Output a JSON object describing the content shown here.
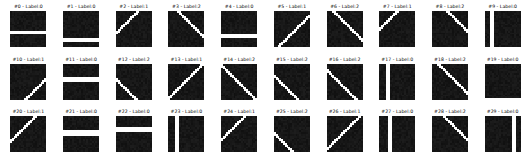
{
  "figure": {
    "background_color": "#ffffff",
    "foreground_color": "#000000",
    "line_color": "#ffffff",
    "image_background_color": "#141414",
    "grid_rows": 3,
    "grid_cols": 10,
    "tile_pixels": 20,
    "total_samples": 30
  },
  "chart_data": {
    "type": "heatmap",
    "title": "",
    "xlabel": "",
    "ylabel": "",
    "legend": [
      "Label:0",
      "Label:1",
      "Label:2"
    ],
    "categories": [
      "Label:0",
      "Label:1",
      "Label:2"
    ],
    "values": [
      13,
      8,
      9
    ],
    "samples": [
      {
        "index": 0,
        "title": "#0 - Label:0",
        "label": 0,
        "pattern": "horizontal",
        "pos": 0.62,
        "thickness": 2,
        "orientation": "h"
      },
      {
        "index": 1,
        "title": "#1 - Label:0",
        "label": 0,
        "pattern": "horizontal",
        "pos": 0.86,
        "thickness": 2,
        "orientation": "h"
      },
      {
        "index": 2,
        "title": "#2 - Label:1",
        "label": 1,
        "pattern": "diagonal-up",
        "pos": 0.1,
        "thickness": 2,
        "orientation": "d1"
      },
      {
        "index": 3,
        "title": "#3 - Label:2",
        "label": 2,
        "pattern": "diagonal-down",
        "pos": 0.18,
        "thickness": 2,
        "orientation": "d2"
      },
      {
        "index": 4,
        "title": "#4 - Label:0",
        "label": 0,
        "pattern": "horizontal",
        "pos": 0.72,
        "thickness": 2,
        "orientation": "h"
      },
      {
        "index": 5,
        "title": "#5 - Label:1",
        "label": 1,
        "pattern": "diagonal-up",
        "pos": 0.62,
        "thickness": 2,
        "orientation": "d1"
      },
      {
        "index": 6,
        "title": "#6 - Label:2",
        "label": 2,
        "pattern": "diagonal-down",
        "pos": 0.3,
        "thickness": 2,
        "orientation": "d2"
      },
      {
        "index": 7,
        "title": "#7 - Label:1",
        "label": 1,
        "pattern": "diagonal-up",
        "pos": 0.02,
        "thickness": 2,
        "orientation": "d1"
      },
      {
        "index": 8,
        "title": "#8 - Label:2",
        "label": 2,
        "pattern": "diagonal-down",
        "pos": 0.05,
        "thickness": 2,
        "orientation": "d2"
      },
      {
        "index": 9,
        "title": "#9 - Label:0",
        "label": 0,
        "pattern": "vertical",
        "pos": 0.14,
        "thickness": 2,
        "orientation": "v"
      },
      {
        "index": 10,
        "title": "#10 - Label:1",
        "label": 1,
        "pattern": "diagonal-up",
        "pos": 0.92,
        "thickness": 2,
        "orientation": "d1"
      },
      {
        "index": 11,
        "title": "#11 - Label:0",
        "label": 0,
        "pattern": "horizontal",
        "pos": 0.42,
        "thickness": 3,
        "orientation": "h"
      },
      {
        "index": 12,
        "title": "#12 - Label:2",
        "label": 2,
        "pattern": "diagonal-down",
        "pos": 0.9,
        "thickness": 2,
        "orientation": "d2"
      },
      {
        "index": 13,
        "title": "#13 - Label:1",
        "label": 1,
        "pattern": "diagonal-up",
        "pos": 0.44,
        "thickness": 2,
        "orientation": "d1"
      },
      {
        "index": 14,
        "title": "#14 - Label:2",
        "label": 2,
        "pattern": "diagonal-down",
        "pos": 0.48,
        "thickness": 2,
        "orientation": "d2"
      },
      {
        "index": 15,
        "title": "#15 - Label:2",
        "label": 2,
        "pattern": "diagonal-down",
        "pos": 0.82,
        "thickness": 2,
        "orientation": "d2"
      },
      {
        "index": 16,
        "title": "#16 - Label:2",
        "label": 2,
        "pattern": "diagonal-down",
        "pos": 0.66,
        "thickness": 2,
        "orientation": "d2"
      },
      {
        "index": 17,
        "title": "#17 - Label:0",
        "label": 0,
        "pattern": "vertical",
        "pos": 0.2,
        "thickness": 2,
        "orientation": "v"
      },
      {
        "index": 18,
        "title": "#18 - Label:2",
        "label": 2,
        "pattern": "diagonal-down",
        "pos": 0.28,
        "thickness": 2,
        "orientation": "d2"
      },
      {
        "index": 19,
        "title": "#19 - Label:0",
        "label": 0,
        "pattern": "horizontal",
        "pos": 0.98,
        "thickness": 1,
        "orientation": "h"
      },
      {
        "index": 20,
        "title": "#20 - Label:1",
        "label": 1,
        "pattern": "diagonal-up",
        "pos": 0.22,
        "thickness": 2,
        "orientation": "d1"
      },
      {
        "index": 21,
        "title": "#21 - Label:0",
        "label": 0,
        "pattern": "horizontal",
        "pos": 0.48,
        "thickness": 3,
        "orientation": "h"
      },
      {
        "index": 22,
        "title": "#22 - Label:0",
        "label": 0,
        "pattern": "horizontal",
        "pos": 0.34,
        "thickness": 3,
        "orientation": "h"
      },
      {
        "index": 23,
        "title": "#23 - Label:0",
        "label": 0,
        "pattern": "vertical",
        "pos": 0.24,
        "thickness": 2,
        "orientation": "v"
      },
      {
        "index": 24,
        "title": "#24 - Label:1",
        "label": 1,
        "pattern": "diagonal-up",
        "pos": 0.16,
        "thickness": 2,
        "orientation": "d1"
      },
      {
        "index": 25,
        "title": "#25 - Label:2",
        "label": 2,
        "pattern": "diagonal-down",
        "pos": 0.96,
        "thickness": 2,
        "orientation": "d2"
      },
      {
        "index": 26,
        "title": "#26 - Label:1",
        "label": 1,
        "pattern": "diagonal-up",
        "pos": 0.4,
        "thickness": 2,
        "orientation": "d1"
      },
      {
        "index": 27,
        "title": "#27 - Label:0",
        "label": 0,
        "pattern": "vertical",
        "pos": 0.26,
        "thickness": 2,
        "orientation": "v"
      },
      {
        "index": 28,
        "title": "#28 - Label:2",
        "label": 2,
        "pattern": "diagonal-down",
        "pos": 0.14,
        "thickness": 2,
        "orientation": "d2"
      },
      {
        "index": 29,
        "title": "#29 - Label:0",
        "label": 0,
        "pattern": "vertical",
        "pos": 0.84,
        "thickness": 2,
        "orientation": "v"
      }
    ]
  }
}
